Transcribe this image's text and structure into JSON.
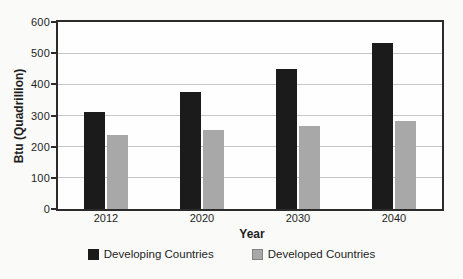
{
  "chart_data": {
    "type": "bar",
    "title": "",
    "xlabel": "Year",
    "ylabel": "Btu (Quadrillion)",
    "categories": [
      "2012",
      "2020",
      "2030",
      "2040"
    ],
    "series": [
      {
        "name": "Developing Countries",
        "color": "#1b1b1b",
        "values": [
          310,
          375,
          450,
          533
        ]
      },
      {
        "name": "Developed Countries",
        "color": "#a8a8a8",
        "values": [
          237,
          255,
          265,
          282
        ]
      }
    ],
    "ylim": [
      0,
      600
    ],
    "ytick_step": 100,
    "yticks": [
      0,
      100,
      200,
      300,
      400,
      500,
      600
    ],
    "grid": "horizontal",
    "gridline_color": "#c6c6c6",
    "axis_color": "#2b2b2b",
    "plot_background": "#fefefe",
    "page_background": "#fafaf8",
    "legend_position": "bottom-center"
  }
}
